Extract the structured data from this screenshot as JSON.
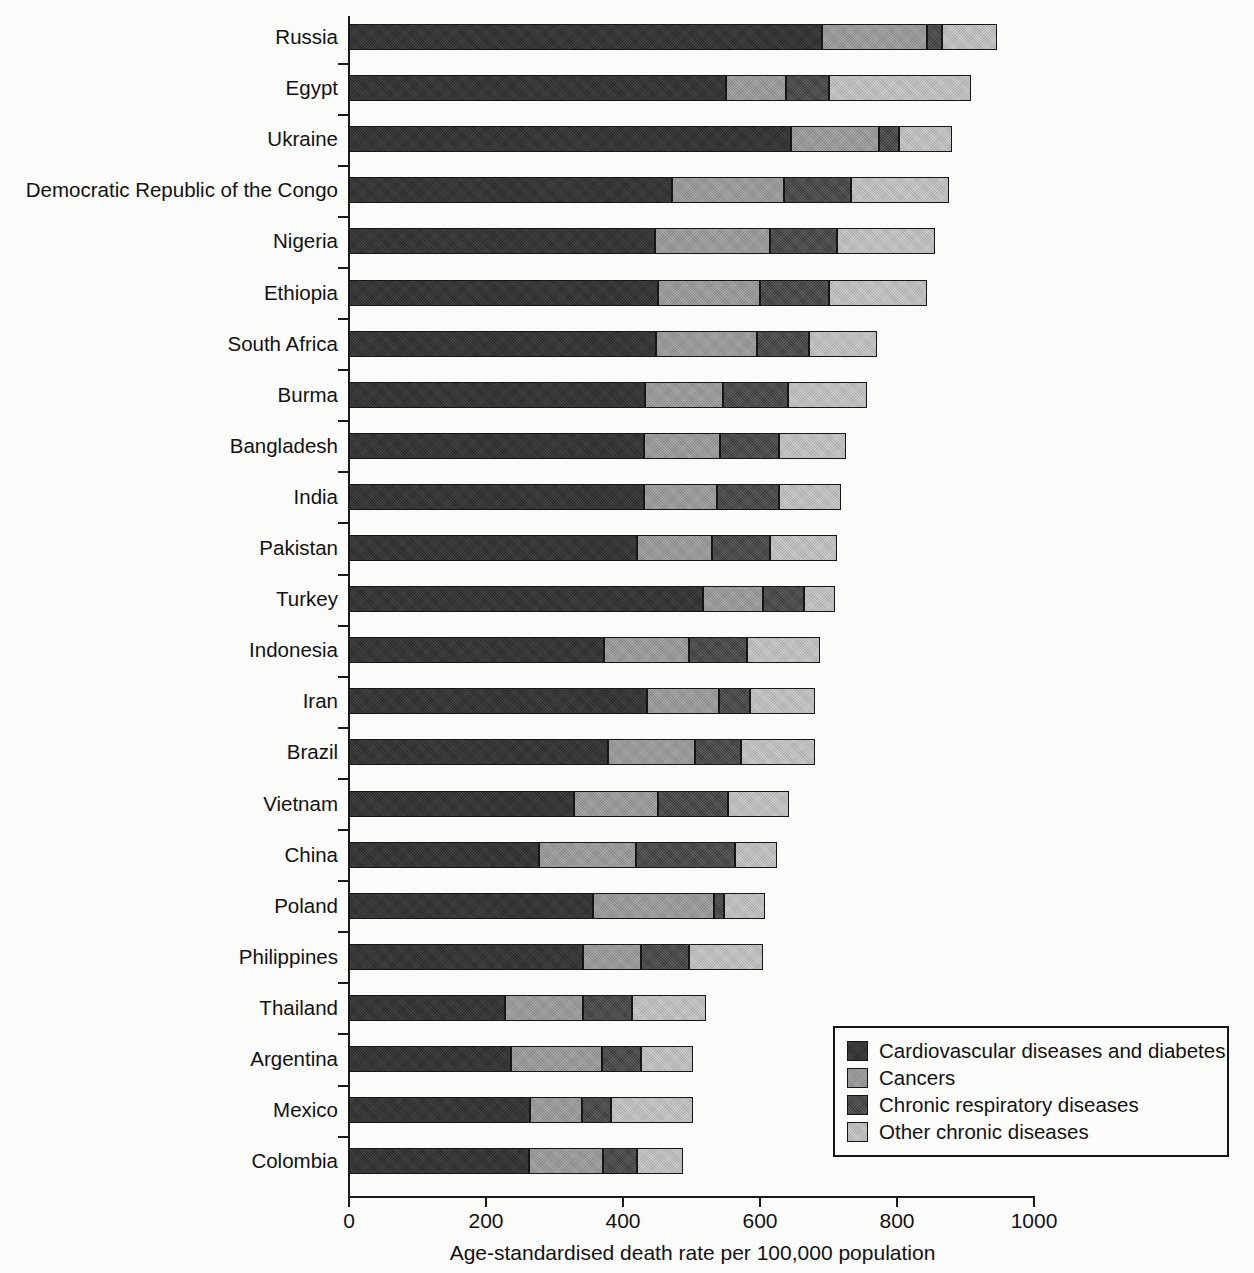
{
  "chart_data": {
    "type": "bar",
    "orientation": "horizontal",
    "stacked": true,
    "title": "",
    "xlabel": "Age-standardised death rate per 100,000 population",
    "ylabel": "",
    "xlim": [
      0,
      1000
    ],
    "xticks": [
      0,
      200,
      400,
      600,
      800,
      1000
    ],
    "xtick_labels": [
      "0",
      "200",
      "400",
      "600",
      "800",
      "1000"
    ],
    "grid": false,
    "legend_position": "bottom-right",
    "categories": [
      "Russia",
      "Egypt",
      "Ukraine",
      "Democratic Republic of the Congo",
      "Nigeria",
      "Ethiopia",
      "South Africa",
      "Burma",
      "Bangladesh",
      "India",
      "Pakistan",
      "Turkey",
      "Indonesia",
      "Iran",
      "Brazil",
      "Vietnam",
      "China",
      "Poland",
      "Philippines",
      "Thailand",
      "Argentina",
      "Mexico",
      "Colombia"
    ],
    "series": [
      {
        "name": "Cardiovascular diseases and diabetes",
        "color": "#2a2a2a",
        "values": [
          690,
          550,
          645,
          472,
          447,
          451,
          448,
          432,
          431,
          431,
          420,
          517,
          372,
          435,
          378,
          328,
          277,
          356,
          342,
          228,
          236,
          264,
          263
        ]
      },
      {
        "name": "Cancers",
        "color": "#a8a8a8",
        "values": [
          154,
          88,
          129,
          163,
          168,
          149,
          148,
          114,
          111,
          106,
          110,
          87,
          125,
          105,
          127,
          123,
          142,
          177,
          84,
          114,
          133,
          76,
          108
        ]
      },
      {
        "name": "Chronic respiratory diseases",
        "color": "#3c3c3c",
        "values": [
          22,
          63,
          29,
          98,
          98,
          100,
          76,
          95,
          86,
          91,
          85,
          60,
          84,
          46,
          67,
          102,
          145,
          14,
          71,
          71,
          57,
          42,
          49
        ]
      },
      {
        "name": "Other chronic diseases",
        "color": "#cccccc",
        "values": [
          80,
          207,
          77,
          143,
          142,
          144,
          99,
          115,
          98,
          90,
          98,
          46,
          107,
          94,
          109,
          89,
          61,
          60,
          107,
          108,
          76,
          120,
          68
        ]
      }
    ],
    "totals": [
      946,
      908,
      880,
      876,
      855,
      844,
      771,
      756,
      726,
      718,
      713,
      710,
      688,
      680,
      681,
      642,
      625,
      607,
      604,
      521,
      502,
      502,
      488
    ]
  },
  "legend": {
    "items": [
      {
        "label": "Cardiovascular diseases and diabetes",
        "swatch": "#2a2a2a",
        "fill_class": "fill-cvd"
      },
      {
        "label": "Cancers",
        "swatch": "#a8a8a8",
        "fill_class": "fill-cancers"
      },
      {
        "label": "Chronic respiratory diseases",
        "swatch": "#3c3c3c",
        "fill_class": "fill-resp"
      },
      {
        "label": "Other chronic diseases",
        "swatch": "#cccccc",
        "fill_class": "fill-other"
      }
    ]
  },
  "axis": {
    "x_title": "Age-standardised death rate per 100,000 population"
  }
}
